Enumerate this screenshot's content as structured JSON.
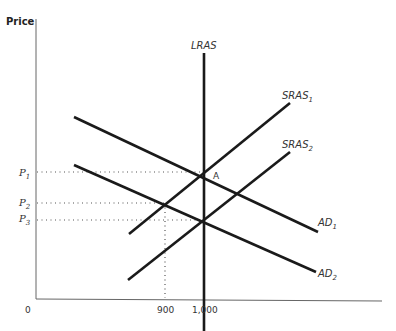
{
  "diagram": {
    "y_axis_label": "Price",
    "origin_label": "0",
    "x_ticks": [
      {
        "label": "900",
        "x": 900
      },
      {
        "label": "1,000",
        "x": 1000
      }
    ],
    "price_levels": [
      {
        "label": "P",
        "sub": "1"
      },
      {
        "label": "P",
        "sub": "2"
      },
      {
        "label": "P",
        "sub": "3"
      }
    ],
    "curves": {
      "lras": {
        "label": "LRAS"
      },
      "sras1": {
        "label": "SRAS",
        "sub": "1"
      },
      "sras2": {
        "label": "SRAS",
        "sub": "2"
      },
      "ad1": {
        "label": "AD",
        "sub": "1"
      },
      "ad2": {
        "label": "AD",
        "sub": "2"
      }
    },
    "point_a": {
      "label": "A"
    },
    "colors": {
      "lines": "#1a1a1a",
      "axis": "#555555",
      "dotted": "#555555"
    }
  }
}
